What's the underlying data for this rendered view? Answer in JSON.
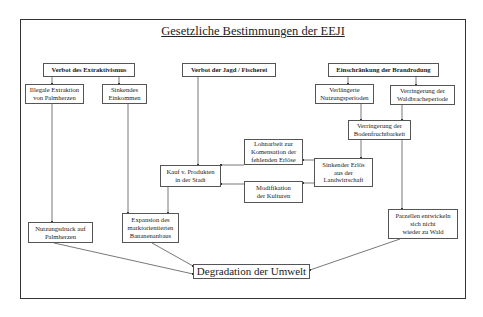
{
  "diagram": {
    "title": "Gesetzliche Bestimmungen der EEJI",
    "nodes": {
      "verbot_extraktivismus": "Verbot des Extraktivismus",
      "verbot_jagd": "Verbot der Jagd / Fischerei",
      "einschraenkung_brandrodung": "Einschränkung der Brandrodung",
      "illegale_extraktion": "Illegale Extraktion\nvon Palmherzen",
      "sinkendes_einkommen": "Sinkendes\nEinkommen",
      "verlaengerte_nutzung": "Verlängerte\nNutzungsperioden",
      "verringerung_waldbrache": "Verringerung der\nWaldbracheperiode",
      "verringerung_boden": "Verringerung der\nBodenfruchtbarkeit",
      "lohnarbeit": "Lohnarbeit zur\nKomensation der\nfehlenden Erlöse",
      "sinkender_erloes": "Sinkender Erlös\naus der\nLandwirtschaft",
      "kauf_produkte": "Kauf v. Produkten\nin der Stadt",
      "modifikation": "Modifikation\nder Kulturen",
      "nutzungsdruck": "Nutzungsdruck auf\nPalmherzen",
      "expansion": "Expansion des\nmarktorientierten\nBananenanbaus",
      "parzellen": "Parzellen entwickeln\nsich nicht\nwieder zu Wald",
      "degradation": "Degradation der Umwelt"
    },
    "edges": [
      [
        "verbot_extraktivismus",
        "illegale_extraktion"
      ],
      [
        "verbot_extraktivismus",
        "sinkendes_einkommen"
      ],
      [
        "einschraenkung_brandrodung",
        "verlaengerte_nutzung"
      ],
      [
        "einschraenkung_brandrodung",
        "verringerung_waldbrache"
      ],
      [
        "verlaengerte_nutzung",
        "verringerung_boden"
      ],
      [
        "verringerung_waldbrache",
        "verringerung_boden"
      ],
      [
        "verringerung_boden",
        "sinkender_erloes"
      ],
      [
        "verringerung_boden",
        "parzellen"
      ],
      [
        "sinkender_erloes",
        "lohnarbeit"
      ],
      [
        "sinkender_erloes",
        "modifikation"
      ],
      [
        "lohnarbeit",
        "kauf_produkte"
      ],
      [
        "modifikation",
        "kauf_produkte"
      ],
      [
        "verbot_jagd",
        "kauf_produkte"
      ],
      [
        "illegale_extraktion",
        "nutzungsdruck"
      ],
      [
        "sinkendes_einkommen",
        "expansion"
      ],
      [
        "kauf_produkte",
        "expansion"
      ],
      [
        "nutzungsdruck",
        "degradation"
      ],
      [
        "expansion",
        "degradation"
      ],
      [
        "parzellen",
        "degradation"
      ]
    ]
  }
}
